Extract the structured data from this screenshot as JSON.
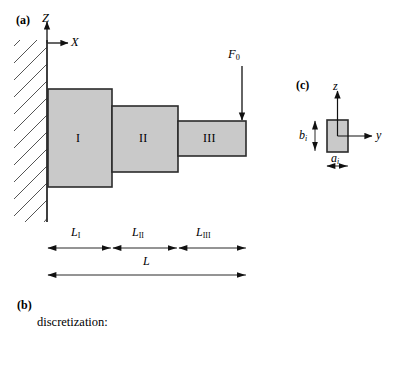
{
  "figure": {
    "width": 403,
    "height": 365,
    "background": "#ffffff"
  },
  "colors": {
    "block_fill": "#c9c9c9",
    "block_stroke": "#2b2b2b",
    "line": "#111111",
    "hatch": "#555555",
    "text": "#000000"
  },
  "panel_a": {
    "tag": "(a)",
    "axes": {
      "vertical_label": "Z",
      "horizontal_label": "X",
      "origin_x": 47,
      "origin_y": 43
    },
    "support": {
      "type": "fixed-wall-hatching",
      "wall_x": 47,
      "wall_top": 40,
      "wall_bottom": 222
    },
    "blocks": [
      {
        "label": "I",
        "x": 48,
        "y": 89,
        "width": 64,
        "height": 98
      },
      {
        "label": "II",
        "x": 112,
        "y": 106,
        "width": 66,
        "height": 66
      },
      {
        "label": "III",
        "x": 178,
        "y": 121,
        "width": 68,
        "height": 35
      }
    ],
    "load": {
      "label": "F",
      "sublabel": "0",
      "arrow_x": 242,
      "arrow_top": 66,
      "arrow_tip_y": 121
    },
    "dimensions": {
      "segments": [
        {
          "label": "L",
          "sublabel": "I",
          "from": 48,
          "to": 112
        },
        {
          "label": "L",
          "sublabel": "II",
          "from": 112,
          "to": 178
        },
        {
          "label": "L",
          "sublabel": "III",
          "from": 178,
          "to": 246
        }
      ],
      "total": {
        "label": "L",
        "from": 48,
        "to": 246
      },
      "segment_line_y": 248,
      "total_line_y": 275
    }
  },
  "panel_b": {
    "tag": "(b)",
    "caption": "discretization:"
  },
  "panel_c": {
    "tag": "(c)",
    "axes": {
      "vertical_label": "z",
      "horizontal_label": "y"
    },
    "section": {
      "x": 327,
      "y": 120,
      "width": 21,
      "height": 32
    },
    "dimensions": {
      "height_label": "b",
      "height_sublabel": "i",
      "width_label": "a",
      "width_sublabel": "i"
    }
  }
}
